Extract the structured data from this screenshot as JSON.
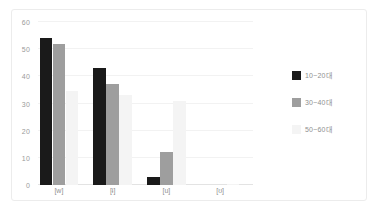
{
  "chart_data": {
    "type": "bar",
    "title": "",
    "xlabel": "",
    "ylabel": "",
    "ylim": [
      0,
      60
    ],
    "yticks": [
      0,
      10,
      20,
      30,
      40,
      50,
      60
    ],
    "grid": true,
    "legend_position": "right",
    "categories": [
      "[w]",
      "[ɨ]",
      "[u]",
      "[ʊ]"
    ],
    "series": [
      {
        "name": "10~20대",
        "color": "#1a1a1a",
        "values": [
          54,
          43,
          3,
          0
        ]
      },
      {
        "name": "30~40대",
        "color": "#9e9e9e",
        "values": [
          52,
          37,
          12,
          0
        ]
      },
      {
        "name": "50~60대",
        "color": "#f4f4f4",
        "values": [
          34.5,
          33,
          31,
          0.5
        ]
      }
    ]
  },
  "figure": {
    "background_color": "#ffffff",
    "frame_color": "#ececec",
    "gridline_color": "#f2f2f2",
    "axis_color": "#e3e3e3",
    "tick_label_color": "#9a9a9a"
  }
}
